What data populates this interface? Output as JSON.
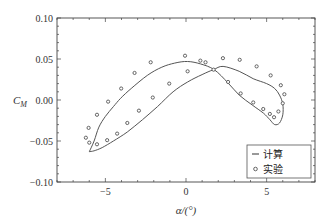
{
  "chart_data": {
    "type": "scatter",
    "title": "",
    "xlabel": "α/(°)",
    "ylabel": "C_M",
    "xlim": [
      -8,
      8
    ],
    "ylim": [
      -0.1,
      0.1
    ],
    "xticks": [
      -5,
      0,
      5
    ],
    "xtick_labels": [
      "−5",
      "0",
      "5"
    ],
    "yticks": [
      -0.1,
      -0.05,
      0.0,
      0.05,
      0.1
    ],
    "ytick_labels": [
      "−0.10",
      "−0.05",
      "0.00",
      "0.05",
      "0.10"
    ],
    "grid": false,
    "legend_position": "lower right",
    "series": [
      {
        "name": "计算",
        "style": "line",
        "closed": true,
        "x": [
          -6.0,
          -5.7,
          -5.4,
          -5.0,
          -4.5,
          -4.06,
          -3.4,
          -2.4,
          -1.5,
          -0.7,
          0.1,
          0.9,
          1.75,
          2.6,
          3.3,
          4.1,
          4.8,
          5.2,
          5.5,
          5.8,
          6.0,
          6.0,
          5.8,
          5.5,
          5.0,
          4.17,
          3.3,
          2.3,
          1.7,
          1.0,
          0.1,
          -0.8,
          -1.77,
          -2.7,
          -3.64,
          -4.5,
          -5.2,
          -5.7,
          -6.0
        ],
        "y": [
          -0.063,
          -0.05,
          -0.033,
          -0.02,
          -0.008,
          0.002,
          0.014,
          0.03,
          0.04,
          0.045,
          0.047,
          0.044,
          0.037,
          0.021,
          0.006,
          -0.006,
          -0.016,
          -0.024,
          -0.03,
          -0.028,
          -0.018,
          -0.005,
          0.006,
          0.014,
          0.02,
          0.026,
          0.035,
          0.041,
          0.037,
          0.031,
          0.022,
          0.01,
          -0.008,
          -0.024,
          -0.039,
          -0.05,
          -0.058,
          -0.062,
          -0.063
        ]
      },
      {
        "name": "实验",
        "style": "markers",
        "x": [
          -2.19,
          -3.19,
          -4.02,
          -4.83,
          -5.52,
          -6.04,
          -6.21,
          -6.0,
          -5.52,
          -4.89,
          -4.27,
          -3.64,
          -2.92,
          -2.06,
          -1.04,
          0.1,
          -0.06,
          0.89,
          1.21,
          2.29,
          3.33,
          4.38,
          5.25,
          5.88,
          6.1,
          6.0,
          5.73,
          5.46,
          5.2,
          4.79,
          4.17,
          3.39,
          2.61,
          1.71
        ],
        "y": [
          0.046,
          0.033,
          0.014,
          -0.002,
          -0.018,
          -0.034,
          -0.046,
          -0.052,
          -0.054,
          -0.049,
          -0.041,
          -0.028,
          -0.013,
          0.003,
          0.02,
          0.035,
          0.054,
          0.048,
          0.046,
          0.051,
          0.049,
          0.041,
          0.03,
          0.018,
          0.007,
          -0.004,
          -0.014,
          -0.021,
          -0.017,
          -0.011,
          -0.003,
          0.008,
          0.022,
          0.037
        ]
      }
    ]
  },
  "legend": {
    "items": [
      {
        "label": "计算",
        "symbol": "line"
      },
      {
        "label": "实验",
        "symbol": "circle"
      }
    ]
  },
  "colors": {
    "axis": "#444444",
    "line": "#555555",
    "marker": "#555555",
    "background": "#ffffff"
  }
}
